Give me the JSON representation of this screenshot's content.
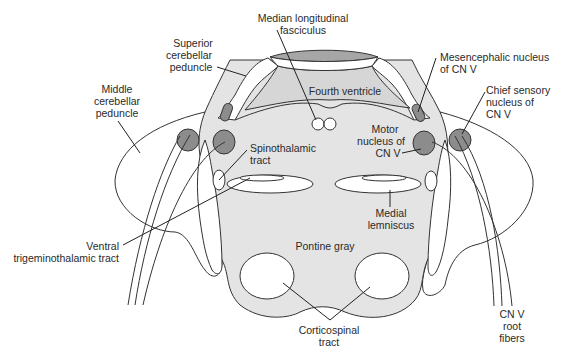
{
  "figure": {
    "colors": {
      "background": "#ffffff",
      "tegmentum_fill": "#dcdcdc",
      "pontine_gray_fill": "#e6e6e6",
      "nucleus_fill": "#8c8c8c",
      "ventricle_roof_fill": "#a8a8a8",
      "outline": "#333333"
    },
    "labels": {
      "mlf_line1": "Median longitudinal",
      "mlf_line2": "fasciculus",
      "scp_line1": "Superior",
      "scp_line2": "cerebellar",
      "scp_line3": "peduncle",
      "mcp_line1": "Middle",
      "mcp_line2": "cerebellar",
      "mcp_line3": "peduncle",
      "fourth_ventricle": "Fourth ventricle",
      "mesencephalic_line1": "Mesencephalic nucleus",
      "mesencephalic_line2": "of CN V",
      "chief_line1": "Chief sensory",
      "chief_line2": "nucleus of",
      "chief_line3": "CN V",
      "motor_line1": "Motor",
      "motor_line2": "nucleus of",
      "motor_line3": "CN V",
      "spinothalamic_line1": "Spinothalamic",
      "spinothalamic_line2": "tract",
      "vtt_line1": "Ventral",
      "vtt_line2": "trigeminothalamic tract",
      "ml_line1": "Medial",
      "ml_line2": "lemniscus",
      "pontine_gray": "Pontine gray",
      "cst_line1": "Corticospinal",
      "cst_line2": "tract",
      "root_line1": "CN V",
      "root_line2": "root",
      "root_line3": "fibers"
    }
  }
}
